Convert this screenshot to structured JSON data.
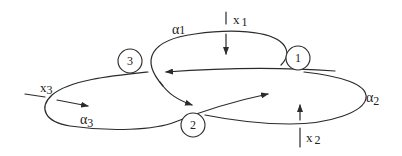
{
  "diagram": {
    "type": "knot/curve diagram",
    "nodes": [
      {
        "id": "1",
        "label": "1"
      },
      {
        "id": "2",
        "label": "2"
      },
      {
        "id": "3",
        "label": "3"
      }
    ],
    "arcs": [
      {
        "id": "alpha1",
        "symbol": "α",
        "index": "1"
      },
      {
        "id": "alpha2",
        "symbol": "α",
        "index": "2"
      },
      {
        "id": "alpha3",
        "symbol": "α",
        "index": "3"
      }
    ],
    "generators": [
      {
        "id": "x1",
        "symbol": "x",
        "index": "1"
      },
      {
        "id": "x2",
        "symbol": "x",
        "index": "2"
      },
      {
        "id": "x3",
        "symbol": "x",
        "index": "3"
      }
    ],
    "colors": {
      "stroke": "#2b2b2b",
      "text": "#222222",
      "background": "#ffffff"
    }
  }
}
